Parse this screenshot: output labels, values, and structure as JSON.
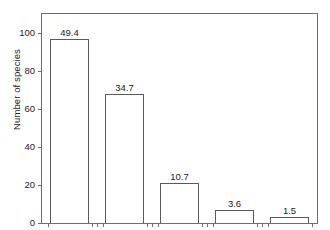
{
  "chart_data": {
    "type": "bar",
    "title": "",
    "subtitle": "",
    "xlabel": "",
    "ylabel": "Number of species",
    "ylim": [
      0,
      110
    ],
    "yticks": [
      0,
      20,
      40,
      60,
      80,
      100
    ],
    "ytick_labels": [
      "0",
      "20",
      "40",
      "60",
      "80",
      "100"
    ],
    "grid": false,
    "legend": false,
    "categories": [
      "",
      "",
      "",
      "",
      ""
    ],
    "values": [
      97,
      68,
      21,
      7,
      3
    ],
    "data_labels": [
      "49.4",
      "34.7",
      "10.7",
      "3.6",
      "1.5"
    ],
    "data_label_note": "percentage of total species",
    "bar_style": {
      "fill": "#ffffff",
      "edge": "#5a5a5a"
    },
    "axis_color": "#6e6e6e",
    "background": "#ffffff",
    "note": "x-axis category labels are cropped off the bottom edge of the screenshot"
  }
}
